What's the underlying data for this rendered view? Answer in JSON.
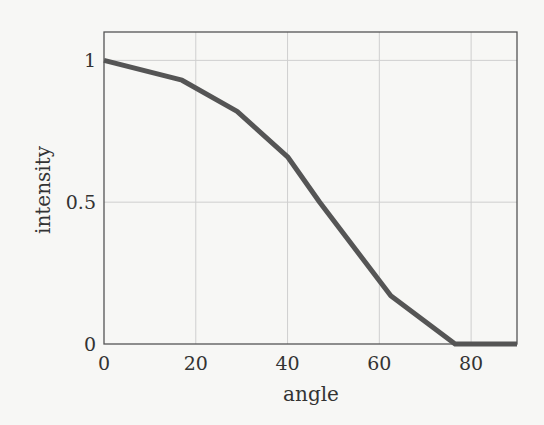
{
  "chart_data": {
    "type": "line",
    "title": "",
    "xlabel": "angle",
    "ylabel": "intensity",
    "xlim": [
      0,
      90
    ],
    "ylim": [
      0,
      1.1
    ],
    "grid": true,
    "legend": null,
    "x_ticks": [
      0,
      20,
      40,
      60,
      80
    ],
    "x_tick_labels": [
      "0",
      "20",
      "40",
      "60",
      "80"
    ],
    "y_ticks": [
      0,
      0.5,
      1
    ],
    "y_tick_labels": [
      "0",
      "0.5",
      "1"
    ],
    "series": [
      {
        "name": "intensity",
        "color": "#555555",
        "x": [
          0,
          17,
          29,
          40,
          47,
          62.5,
          76.5,
          90
        ],
        "y": [
          1.0,
          0.93,
          0.82,
          0.66,
          0.5,
          0.17,
          0.0,
          0.0
        ]
      }
    ]
  },
  "colors": {
    "background": "#f7f7f5",
    "frame": "#555555",
    "grid": "#cfcfcf",
    "line": "#555555",
    "text": "#333333"
  }
}
